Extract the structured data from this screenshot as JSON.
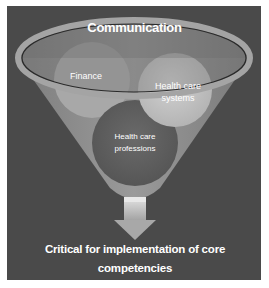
{
  "diagram": {
    "title": "Communication",
    "items": [
      {
        "label": "Finance"
      },
      {
        "label": "Health care systems"
      },
      {
        "label": "Health care professions"
      }
    ],
    "conclusion": "Critical for implementation of core competencies",
    "colors": {
      "background": "#4a4a4a",
      "funnel_rim": "#9c9c9c",
      "funnel_body": "#8a8a8a",
      "ellipse_top": "#6e6e6e",
      "finance_circle": "#a6a6a6",
      "systems_circle": "#c4c4c4",
      "professions_circle": "#5f5f5f",
      "arrow": "#b8b8b8",
      "text": "#ffffff"
    }
  }
}
